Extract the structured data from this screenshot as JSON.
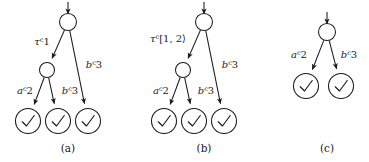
{
  "figure": {
    "background": "#ffffff",
    "ink": "#1a1a1a",
    "panels": [
      {
        "id": "a",
        "caption": "(a)",
        "caption_x": 68,
        "caption_y": 152,
        "entry_arrow": {
          "x": 68,
          "y1": 2,
          "y2": 14
        },
        "nodes": [
          {
            "name": "root",
            "x": 68,
            "y": 22,
            "r": 8.5,
            "kind": "state"
          },
          {
            "name": "inner",
            "x": 47,
            "y": 70,
            "r": 7.5,
            "kind": "state"
          },
          {
            "name": "leaf-1",
            "x": 28,
            "y": 121,
            "r": 12.5,
            "kind": "accept"
          },
          {
            "name": "leaf-2",
            "x": 58,
            "y": 121,
            "r": 12.5,
            "kind": "accept"
          },
          {
            "name": "leaf-3",
            "x": 88,
            "y": 121,
            "r": 12.5,
            "kind": "accept"
          }
        ],
        "edges": [
          {
            "name": "root-to-inner",
            "from": "root",
            "to": "inner",
            "label": {
              "sym": "τ",
              "sup": "c",
              "val": "1",
              "x": 42,
              "y": 45
            }
          },
          {
            "name": "root-to-leaf-3",
            "from": "root",
            "to": "leaf-3",
            "label": {
              "sym": "b",
              "sup": "c",
              "val": "3",
              "x": 94,
              "y": 68
            }
          },
          {
            "name": "inner-to-leaf-1",
            "from": "inner",
            "to": "leaf-1",
            "label": {
              "sym": "a",
              "sup": "c",
              "val": "2",
              "x": 25,
              "y": 94
            }
          },
          {
            "name": "inner-to-leaf-2",
            "from": "inner",
            "to": "leaf-2",
            "label": {
              "sym": "b",
              "sup": "c",
              "val": "3",
              "x": 70,
              "y": 94
            }
          }
        ]
      },
      {
        "id": "b",
        "caption": "(b)",
        "caption_x": 204,
        "caption_y": 152,
        "entry_arrow": {
          "x": 204,
          "y1": 2,
          "y2": 14
        },
        "nodes": [
          {
            "name": "root",
            "x": 204,
            "y": 22,
            "r": 8.5,
            "kind": "state"
          },
          {
            "name": "inner",
            "x": 183,
            "y": 70,
            "r": 7.5,
            "kind": "state"
          },
          {
            "name": "leaf-1",
            "x": 164,
            "y": 121,
            "r": 12.5,
            "kind": "accept"
          },
          {
            "name": "leaf-2",
            "x": 194,
            "y": 121,
            "r": 12.5,
            "kind": "accept"
          },
          {
            "name": "leaf-3",
            "x": 224,
            "y": 121,
            "r": 12.5,
            "kind": "accept"
          }
        ],
        "edges": [
          {
            "name": "root-to-inner",
            "from": "root",
            "to": "inner",
            "label": {
              "sym": "τ",
              "sup": "c",
              "val": "[1, 2⟩",
              "x": 168,
              "y": 42
            }
          },
          {
            "name": "root-to-leaf-3",
            "from": "root",
            "to": "leaf-3",
            "label": {
              "sym": "b",
              "sup": "c",
              "val": "3",
              "x": 230,
              "y": 68
            }
          },
          {
            "name": "inner-to-leaf-1",
            "from": "inner",
            "to": "leaf-1",
            "label": {
              "sym": "a",
              "sup": "c",
              "val": "2",
              "x": 161,
              "y": 94
            }
          },
          {
            "name": "inner-to-leaf-2",
            "from": "inner",
            "to": "leaf-2",
            "label": {
              "sym": "b",
              "sup": "c",
              "val": "3",
              "x": 206,
              "y": 94
            }
          }
        ]
      },
      {
        "id": "c",
        "caption": "(c)",
        "caption_x": 327,
        "caption_y": 152,
        "entry_arrow": {
          "x": 327,
          "y1": 12,
          "y2": 24
        },
        "nodes": [
          {
            "name": "root",
            "x": 327,
            "y": 32,
            "r": 8.5,
            "kind": "state"
          },
          {
            "name": "leaf-1",
            "x": 306,
            "y": 86,
            "r": 12.5,
            "kind": "accept"
          },
          {
            "name": "leaf-2",
            "x": 341,
            "y": 86,
            "r": 12.5,
            "kind": "accept"
          }
        ],
        "edges": [
          {
            "name": "root-to-leaf-1",
            "from": "root",
            "to": "leaf-1",
            "label": {
              "sym": "a",
              "sup": "c",
              "val": "2",
              "x": 299,
              "y": 58
            }
          },
          {
            "name": "root-to-leaf-2",
            "from": "root",
            "to": "leaf-2",
            "label": {
              "sym": "b",
              "sup": "c",
              "val": "3",
              "x": 349,
              "y": 58
            }
          }
        ]
      }
    ]
  }
}
